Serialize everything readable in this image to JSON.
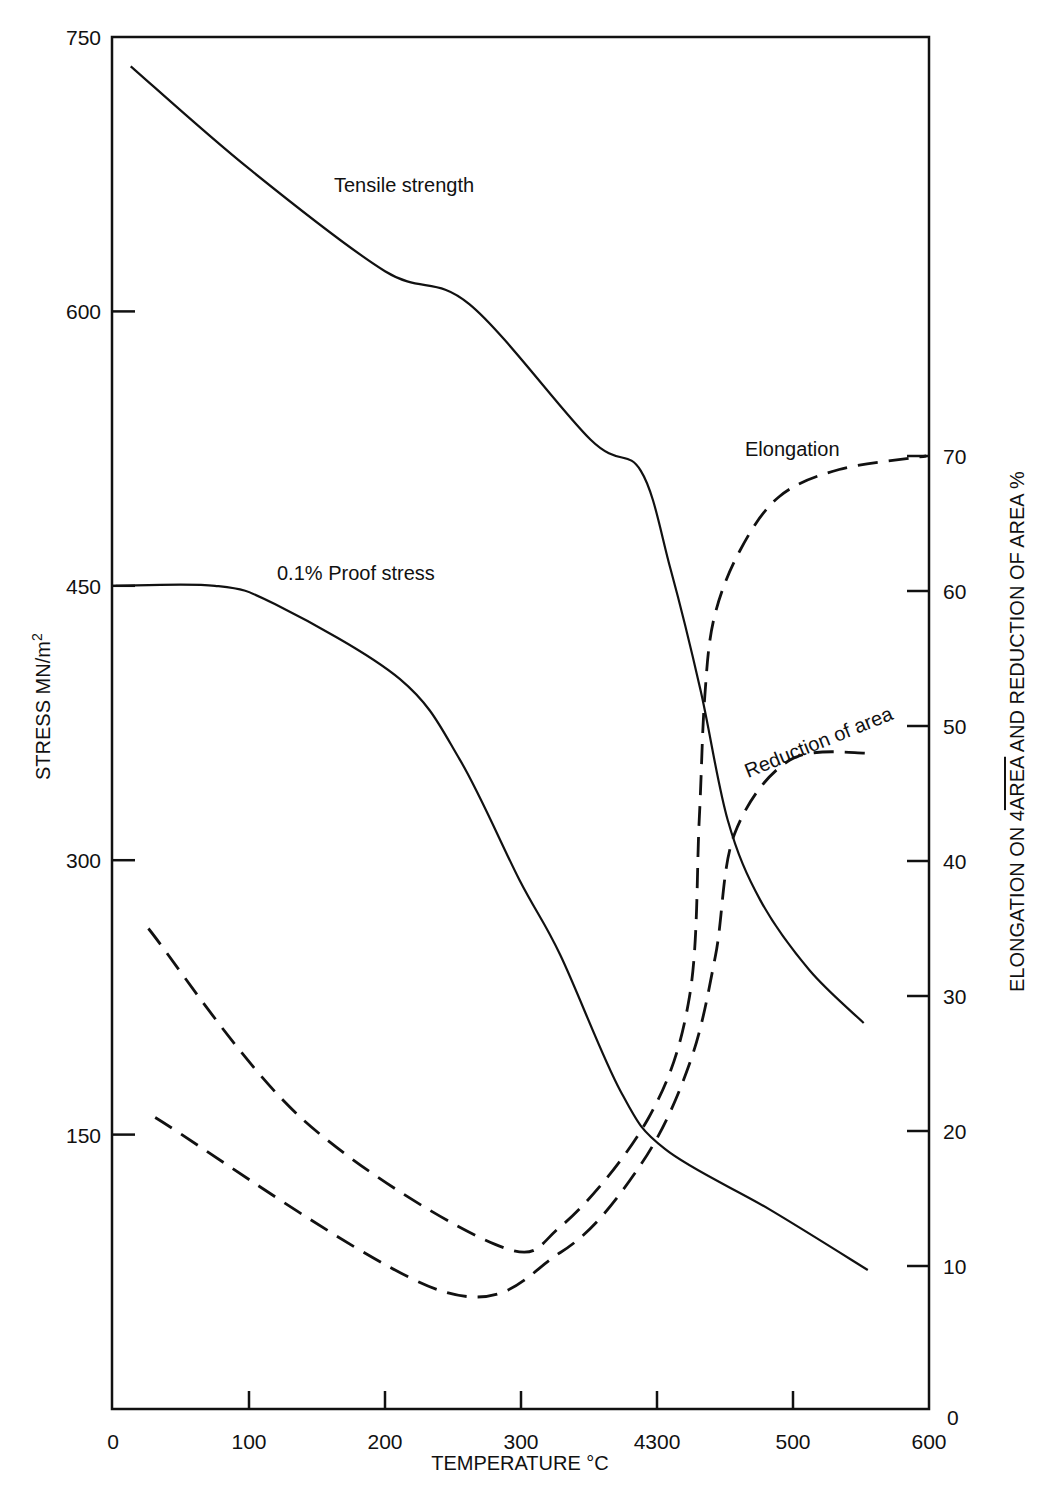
{
  "chart_data": {
    "type": "line",
    "title": "",
    "xlabel": "TEMPERATURE °C",
    "ylabel": "STRESS MN/m²",
    "y2label": "ELONGATION ON 4√AREA AND REDUCTION OF AREA %",
    "xlim": [
      0,
      600
    ],
    "ylim": [
      0,
      750
    ],
    "y2lim": [
      0,
      80
    ],
    "grid": false,
    "legend": "inline labels",
    "x_ticks": [
      "0",
      "100",
      "200",
      "300",
      "4300",
      "500",
      "600"
    ],
    "x_tick_values": [
      0,
      100,
      200,
      300,
      400,
      500,
      600
    ],
    "y_ticks": [
      "150",
      "300",
      "450",
      "600",
      "750"
    ],
    "y_tick_values": [
      150,
      300,
      450,
      600,
      750
    ],
    "y2_ticks": [
      "0",
      "10",
      "20",
      "30",
      "40",
      "50",
      "60",
      "70"
    ],
    "y2_tick_values": [
      0,
      10,
      20,
      30,
      40,
      50,
      60,
      70
    ],
    "series": [
      {
        "name": "Tensile strength",
        "axis": "left",
        "style": "solid",
        "x": [
          13,
          100,
          200,
          262,
          351,
          388,
          410,
          432,
          452,
          476,
          512,
          552
        ],
        "values": [
          734,
          678,
          622,
          604,
          530,
          513,
          459,
          393,
          322,
          278,
          240,
          211
        ]
      },
      {
        "name": "0.1% Proof stress",
        "axis": "left",
        "style": "solid",
        "x": [
          2,
          75,
          119,
          211,
          255,
          299,
          329,
          373,
          406,
          483,
          555
        ],
        "values": [
          450,
          450,
          440,
          399,
          355,
          289,
          248,
          174,
          142,
          109,
          76
        ]
      },
      {
        "name": "Elongation",
        "axis": "right",
        "style": "dashed",
        "x": [
          26,
          138,
          281,
          330,
          394,
          424,
          431,
          435,
          442,
          461,
          490,
          534,
          598
        ],
        "values": [
          35,
          21,
          11.6,
          13,
          21,
          30,
          43,
          52,
          58,
          63,
          67,
          69,
          70
        ]
      },
      {
        "name": "Reduction of area",
        "axis": "right",
        "style": "dashed",
        "x": [
          31,
          240,
          329,
          388,
          424,
          443,
          457,
          498,
          557
        ],
        "values": [
          21,
          8.2,
          11,
          17.5,
          25,
          33,
          42,
          47.5,
          48
        ]
      }
    ],
    "annotations": [
      "Tensile strength",
      "0.1% Proof stress",
      "Elongation",
      "Reduction of area"
    ]
  },
  "labels": {
    "y_axis_title": "STRESS MN/m",
    "y_axis_title_sup": "2",
    "y2_axis_title_pre": "ELONGATION ON 4",
    "y2_axis_title_over": "AREA",
    "y2_axis_title_post": " AND REDUCTION OF AREA %",
    "x_axis_title": "TEMPERATURE °C",
    "tensile": "Tensile strength",
    "proof": "0.1% Proof stress",
    "elongation": "Elongation",
    "reduction": "Reduction of area"
  }
}
